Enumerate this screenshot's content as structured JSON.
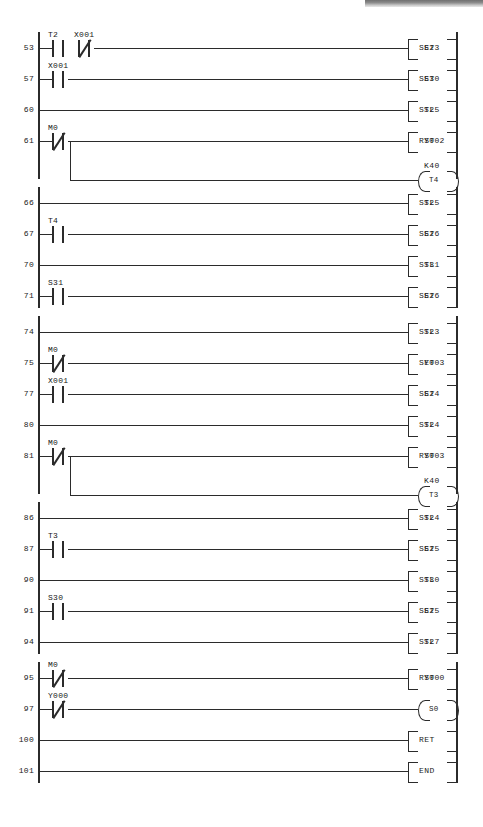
{
  "document": {
    "type": "ladder-logic-diagram",
    "family": "Mitsubishi FX step-ladder (STL)",
    "first_step": "53",
    "last_step": "101"
  },
  "symbols": {
    "contact_no": "-| |-",
    "contact_nc": "-|/|-",
    "bracket_left": "[",
    "bracket_right": "]",
    "coil_open": "(",
    "coil_close": ")"
  },
  "rungs": [
    {
      "step": "53",
      "contacts": [
        {
          "label": "T2",
          "type": "no"
        },
        {
          "label": "X001",
          "type": "nc"
        }
      ],
      "instruction": "SET",
      "operand": "S23",
      "block_start": false
    },
    {
      "step": "57",
      "contacts": [
        {
          "label": "X001",
          "type": "no"
        }
      ],
      "instruction": "SET",
      "operand": "S30",
      "block_start": false
    },
    {
      "step": "60",
      "contacts": [],
      "instruction": "STL",
      "operand": "S25",
      "block_start": false
    },
    {
      "step": "61",
      "contacts": [
        {
          "label": "M0",
          "type": "nc"
        }
      ],
      "instruction": "RST",
      "operand": "Y002",
      "block_start": false,
      "branch": {
        "coil": "T4",
        "preset": "K40"
      }
    },
    {
      "step": "66",
      "contacts": [],
      "instruction": "STL",
      "operand": "S25",
      "block_start": true
    },
    {
      "step": "67",
      "contacts": [
        {
          "label": "T4",
          "type": "no"
        }
      ],
      "instruction": "SET",
      "operand": "S26",
      "block_start": false
    },
    {
      "step": "70",
      "contacts": [],
      "instruction": "STL",
      "operand": "S31",
      "block_start": false
    },
    {
      "step": "71",
      "contacts": [
        {
          "label": "S31",
          "type": "no"
        }
      ],
      "instruction": "SET",
      "operand": "S26",
      "block_start": false
    },
    {
      "step": "74",
      "contacts": [],
      "instruction": "STL",
      "operand": "S23",
      "block_start": true
    },
    {
      "step": "75",
      "contacts": [
        {
          "label": "M0",
          "type": "nc"
        }
      ],
      "instruction": "SET",
      "operand": "Y003",
      "block_start": false
    },
    {
      "step": "77",
      "contacts": [
        {
          "label": "X001",
          "type": "no"
        }
      ],
      "instruction": "SET",
      "operand": "S24",
      "block_start": false
    },
    {
      "step": "80",
      "contacts": [],
      "instruction": "STL",
      "operand": "S24",
      "block_start": false
    },
    {
      "step": "81",
      "contacts": [
        {
          "label": "M0",
          "type": "nc"
        }
      ],
      "instruction": "RST",
      "operand": "Y003",
      "block_start": false,
      "branch": {
        "coil": "T3",
        "preset": "K40"
      }
    },
    {
      "step": "86",
      "contacts": [],
      "instruction": "STL",
      "operand": "S24",
      "block_start": true
    },
    {
      "step": "87",
      "contacts": [
        {
          "label": "T3",
          "type": "no"
        }
      ],
      "instruction": "SET",
      "operand": "S25",
      "block_start": false
    },
    {
      "step": "90",
      "contacts": [],
      "instruction": "STL",
      "operand": "S30",
      "block_start": false
    },
    {
      "step": "91",
      "contacts": [
        {
          "label": "S30",
          "type": "no"
        }
      ],
      "instruction": "SET",
      "operand": "S25",
      "block_start": false
    },
    {
      "step": "94",
      "contacts": [],
      "instruction": "STL",
      "operand": "S27",
      "block_start": false
    },
    {
      "step": "95",
      "contacts": [
        {
          "label": "M0",
          "type": "nc"
        }
      ],
      "instruction": "RST",
      "operand": "Y000",
      "block_start": true
    },
    {
      "step": "97",
      "contacts": [
        {
          "label": "Y000",
          "type": "nc"
        }
      ],
      "coil": "S0",
      "block_start": false
    },
    {
      "step": "100",
      "contacts": [],
      "instruction": "RET",
      "operand": "",
      "block_start": false
    },
    {
      "step": "101",
      "contacts": [],
      "instruction": "END",
      "operand": "",
      "block_start": false
    }
  ]
}
